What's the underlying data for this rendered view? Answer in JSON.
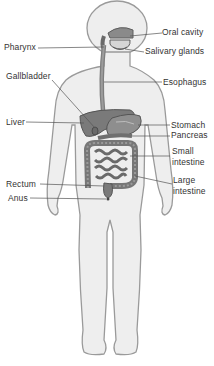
{
  "diagram": {
    "type": "anatomical-figure",
    "colors": {
      "body_fill": "#eeeeee",
      "body_outline": "#9a9a9a",
      "organ_fill": "#8a8a8a",
      "organ_dark": "#5e5e5e",
      "leader_line": "#555555",
      "text": "#333333"
    },
    "labels": [
      {
        "id": "oral-cavity",
        "text": "Oral cavity",
        "side": "right"
      },
      {
        "id": "pharynx",
        "text": "Pharynx",
        "side": "left"
      },
      {
        "id": "salivary-glands",
        "text": "Salivary glands",
        "side": "right"
      },
      {
        "id": "gallbladder",
        "text": "Gallbladder",
        "side": "left"
      },
      {
        "id": "esophagus",
        "text": "Esophagus",
        "side": "right"
      },
      {
        "id": "liver",
        "text": "Liver",
        "side": "left"
      },
      {
        "id": "stomach",
        "text": "Stomach",
        "side": "right"
      },
      {
        "id": "pancreas",
        "text": "Pancreas",
        "side": "right"
      },
      {
        "id": "small-intestine",
        "text": "Small intestine",
        "line1": "Small",
        "line2": "intestine",
        "side": "right"
      },
      {
        "id": "rectum",
        "text": "Rectum",
        "side": "left"
      },
      {
        "id": "large-intestine",
        "text": "Large intestine",
        "line1": "Large",
        "line2": "intestine",
        "side": "right"
      },
      {
        "id": "anus",
        "text": "Anus",
        "side": "left"
      }
    ]
  }
}
